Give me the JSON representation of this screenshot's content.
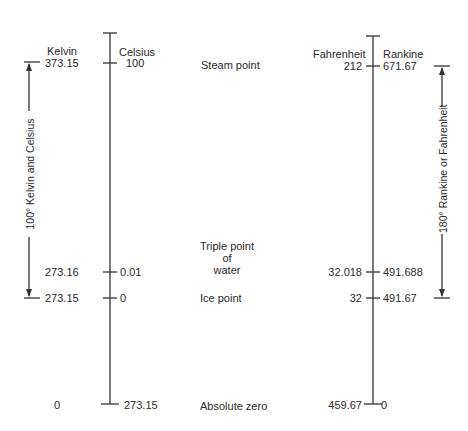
{
  "diagram": {
    "scales": {
      "kelvin": "Kelvin",
      "celsius": "Celsius",
      "fahrenheit": "Fahrenheit",
      "rankine": "Rankine"
    },
    "points": [
      {
        "label": "Steam point",
        "kelvin": "373.15",
        "celsius": "100",
        "fahrenheit": "212",
        "rankine": "671.67"
      },
      {
        "label_lines": [
          "Triple point",
          "of",
          "water"
        ],
        "kelvin": "273.16",
        "celsius": "0.01",
        "fahrenheit": "32.018",
        "rankine": "491.688"
      },
      {
        "label": "Ice point",
        "kelvin": "273.15",
        "celsius": "0",
        "fahrenheit": "32",
        "rankine": "491.67"
      },
      {
        "label": "Absolute zero",
        "kelvin": "0",
        "celsius": "273.15",
        "fahrenheit": "459.67",
        "rankine": "0"
      }
    ],
    "spans": {
      "left": "100° Kelvin and Celsius",
      "right": "180° Rankine or Fahrenheit"
    }
  }
}
